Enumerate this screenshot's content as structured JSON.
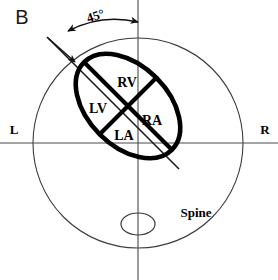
{
  "figure": {
    "panel_letter": "B",
    "description_type": "diagram"
  },
  "annotations": {
    "angle": {
      "value": "45",
      "unit": "°",
      "label": "45°"
    },
    "orientation": {
      "left": "L",
      "right": "R"
    },
    "spine": {
      "label": "Spine"
    }
  },
  "chambers": [
    {
      "abbr": "RV",
      "name": "right-ventricle"
    },
    {
      "abbr": "LV",
      "name": "left-ventricle"
    },
    {
      "abbr": "RA",
      "name": "right-atrium"
    },
    {
      "abbr": "LA",
      "name": "left-atrium"
    }
  ],
  "colors": {
    "background": "#ffffff",
    "heart_stroke": "#000000",
    "thorax_stroke": "#3a3a3a",
    "axis_stroke": "#4a4a4a",
    "text": "#000000"
  }
}
